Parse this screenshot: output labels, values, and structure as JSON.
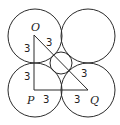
{
  "diagram": {
    "type": "geometry",
    "circles": [
      {
        "name": "top-left",
        "cx": 35,
        "cy": 36,
        "r": 27
      },
      {
        "name": "top-right",
        "cx": 88,
        "cy": 36,
        "r": 27
      },
      {
        "name": "bottom-left",
        "cx": 35,
        "cy": 90,
        "r": 27
      },
      {
        "name": "bottom-right",
        "cx": 88,
        "cy": 90,
        "r": 27
      },
      {
        "name": "center-small",
        "cx": 61,
        "cy": 63,
        "r": 11
      }
    ],
    "points": {
      "O": {
        "label": "O",
        "x": 34,
        "y": 35
      },
      "P": {
        "label": "P",
        "x": 34,
        "y": 90
      },
      "Q": {
        "label": "Q",
        "x": 88,
        "y": 90
      }
    },
    "segment_labels": {
      "OP_upper": "3",
      "OP_lower": "3",
      "PQ_left": "3",
      "PQ_right": "3",
      "OQ_upper": "3",
      "OQ_lower": "3"
    }
  }
}
